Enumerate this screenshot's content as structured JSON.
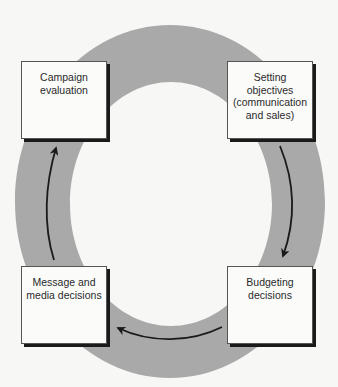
{
  "diagram": {
    "type": "cycle",
    "ring_color": "#a9a9a9",
    "arrow_color": "#1a1a1a",
    "stages": [
      {
        "id": "setting-objectives",
        "lines": [
          "Setting",
          "objectives",
          "(communication",
          "and sales)"
        ]
      },
      {
        "id": "budgeting-decisions",
        "lines": [
          "Budgeting",
          "decisions"
        ]
      },
      {
        "id": "message-media-decisions",
        "lines": [
          "Message and",
          "media decisions"
        ]
      },
      {
        "id": "campaign-evaluation",
        "lines": [
          "Campaign",
          "evaluation"
        ]
      }
    ],
    "flow": [
      {
        "from": "setting-objectives",
        "to": "budgeting-decisions"
      },
      {
        "from": "budgeting-decisions",
        "to": "message-media-decisions"
      },
      {
        "from": "message-media-decisions",
        "to": "campaign-evaluation"
      }
    ]
  }
}
